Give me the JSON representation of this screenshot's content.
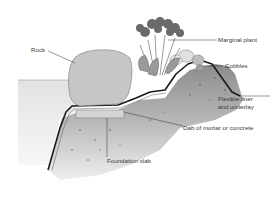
{
  "diagram": {
    "title": "",
    "type": "pond edge cross-section",
    "labels": {
      "rock": "Rock",
      "marginal_plant": "Marginal plant",
      "cobbles": "Cobbles",
      "flexible_liner_line1": "Flexible liner",
      "flexible_liner_line2": "and underlay",
      "dab": "Dab of mortar or concrete",
      "foundation": "Foundation slab"
    },
    "colors": {
      "soil_dark": "#7a7a7a",
      "soil_light": "#d8d8d8",
      "rock": "#c8c8c8",
      "liner": "#1a1a1a",
      "slab": "#d4d4d4",
      "water": "#e4e4e4",
      "leader": "#333333"
    }
  }
}
